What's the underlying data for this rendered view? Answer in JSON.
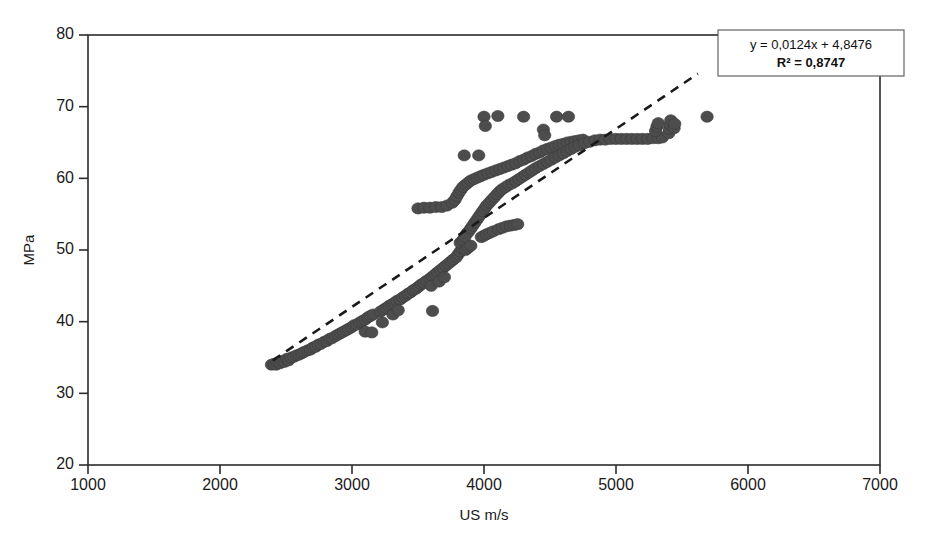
{
  "chart_data": {
    "type": "scatter",
    "title": "",
    "xlabel": "US m/s",
    "ylabel": "MPa",
    "xlim": [
      1000,
      7000
    ],
    "ylim": [
      20,
      80
    ],
    "xticks": [
      1000,
      2000,
      3000,
      4000,
      5000,
      6000,
      7000
    ],
    "yticks": [
      20,
      30,
      40,
      50,
      60,
      70,
      80
    ],
    "grid": false,
    "legend": "none",
    "marker_color": "#4d4d4d",
    "trendline_color": "#1a1a1a",
    "trendline_style": "dashed",
    "annotation": {
      "equation": "y = 0,0124x + 4,8476",
      "r_squared": "R² = 0,8747",
      "slope": 0.0124,
      "intercept": 4.8476,
      "r2": 0.8747,
      "position": "top-right"
    },
    "trendline_segment": {
      "x0": 2400,
      "y0": 34.6,
      "x1": 5620,
      "y1": 74.6
    },
    "series": [
      {
        "name": "UPV vs Compressive Strength",
        "points": [
          [
            2390,
            34.0
          ],
          [
            2410,
            34.1
          ],
          [
            2425,
            34.0
          ],
          [
            2440,
            34.3
          ],
          [
            2455,
            34.2
          ],
          [
            2470,
            34.5
          ],
          [
            2490,
            34.4
          ],
          [
            2505,
            34.8
          ],
          [
            2520,
            34.6
          ],
          [
            2540,
            35.0
          ],
          [
            2560,
            35.1
          ],
          [
            2580,
            35.3
          ],
          [
            2600,
            35.4
          ],
          [
            2620,
            35.6
          ],
          [
            2640,
            35.8
          ],
          [
            2665,
            36.0
          ],
          [
            2685,
            36.1
          ],
          [
            2705,
            36.4
          ],
          [
            2725,
            36.5
          ],
          [
            2745,
            36.8
          ],
          [
            2765,
            36.9
          ],
          [
            2790,
            37.2
          ],
          [
            2810,
            37.3
          ],
          [
            2830,
            37.6
          ],
          [
            2850,
            37.7
          ],
          [
            2875,
            38.0
          ],
          [
            2895,
            38.2
          ],
          [
            2915,
            38.4
          ],
          [
            2935,
            38.6
          ],
          [
            2955,
            38.8
          ],
          [
            2975,
            39.0
          ],
          [
            2995,
            39.2
          ],
          [
            3015,
            39.5
          ],
          [
            3035,
            39.6
          ],
          [
            3060,
            39.9
          ],
          [
            3080,
            40.1
          ],
          [
            3100,
            40.3
          ],
          [
            3120,
            40.6
          ],
          [
            3140,
            40.8
          ],
          [
            3160,
            41.0
          ],
          [
            3100,
            38.6
          ],
          [
            3150,
            38.5
          ],
          [
            3215,
            41.4
          ],
          [
            3240,
            41.7
          ],
          [
            3260,
            41.9
          ],
          [
            3280,
            42.2
          ],
          [
            3300,
            42.4
          ],
          [
            3320,
            42.6
          ],
          [
            3340,
            42.9
          ],
          [
            3365,
            43.1
          ],
          [
            3385,
            43.4
          ],
          [
            3405,
            43.6
          ],
          [
            3425,
            43.9
          ],
          [
            3445,
            44.1
          ],
          [
            3465,
            44.4
          ],
          [
            3230,
            39.9
          ],
          [
            3310,
            41.0
          ],
          [
            3350,
            41.6
          ],
          [
            3485,
            44.6
          ],
          [
            3505,
            44.9
          ],
          [
            3525,
            45.2
          ],
          [
            3545,
            45.4
          ],
          [
            3565,
            45.7
          ],
          [
            3590,
            46.0
          ],
          [
            3610,
            46.3
          ],
          [
            3630,
            46.6
          ],
          [
            3650,
            46.9
          ],
          [
            3670,
            47.2
          ],
          [
            3690,
            47.5
          ],
          [
            3710,
            47.8
          ],
          [
            3730,
            48.1
          ],
          [
            3750,
            48.4
          ],
          [
            3770,
            48.7
          ],
          [
            3790,
            49.0
          ],
          [
            3805,
            49.4
          ],
          [
            3820,
            49.8
          ],
          [
            3835,
            50.2
          ],
          [
            3850,
            50.6
          ],
          [
            3600,
            45.0
          ],
          [
            3660,
            45.6
          ],
          [
            3700,
            46.2
          ],
          [
            3610,
            41.5
          ],
          [
            3500,
            55.8
          ],
          [
            3545,
            55.9
          ],
          [
            3590,
            55.9
          ],
          [
            3635,
            56.0
          ],
          [
            3680,
            56.0
          ],
          [
            3720,
            56.2
          ],
          [
            3760,
            56.6
          ],
          [
            3780,
            57.0
          ],
          [
            3795,
            57.5
          ],
          [
            3810,
            58.0
          ],
          [
            3825,
            58.4
          ],
          [
            3840,
            58.8
          ],
          [
            3860,
            59.1
          ],
          [
            3880,
            59.4
          ],
          [
            3900,
            59.7
          ],
          [
            3925,
            59.9
          ],
          [
            3950,
            60.1
          ],
          [
            3975,
            60.3
          ],
          [
            4000,
            60.5
          ],
          [
            4030,
            60.7
          ],
          [
            4060,
            60.9
          ],
          [
            4090,
            61.1
          ],
          [
            4120,
            61.3
          ],
          [
            4150,
            61.5
          ],
          [
            4180,
            61.7
          ],
          [
            4210,
            61.9
          ],
          [
            4240,
            62.1
          ],
          [
            4270,
            62.4
          ],
          [
            4300,
            62.6
          ],
          [
            4330,
            62.9
          ],
          [
            4360,
            63.1
          ],
          [
            4390,
            63.4
          ],
          [
            4420,
            63.6
          ],
          [
            4450,
            63.9
          ],
          [
            4480,
            64.1
          ],
          [
            4510,
            64.3
          ],
          [
            4540,
            64.5
          ],
          [
            4570,
            64.7
          ],
          [
            4600,
            64.8
          ],
          [
            4630,
            65.0
          ],
          [
            4660,
            65.1
          ],
          [
            4690,
            65.2
          ],
          [
            4720,
            65.3
          ],
          [
            4750,
            65.4
          ],
          [
            3870,
            52.3
          ],
          [
            3885,
            52.6
          ],
          [
            3900,
            53.0
          ],
          [
            3915,
            53.4
          ],
          [
            3930,
            53.8
          ],
          [
            3945,
            54.2
          ],
          [
            3960,
            54.6
          ],
          [
            3975,
            55.0
          ],
          [
            3990,
            55.4
          ],
          [
            4005,
            55.8
          ],
          [
            4020,
            56.2
          ],
          [
            4040,
            56.6
          ],
          [
            4060,
            57.0
          ],
          [
            4080,
            57.4
          ],
          [
            4100,
            57.8
          ],
          [
            4120,
            58.2
          ],
          [
            4140,
            58.5
          ],
          [
            4165,
            58.8
          ],
          [
            4190,
            59.1
          ],
          [
            4215,
            59.3
          ],
          [
            4240,
            59.6
          ],
          [
            4265,
            59.9
          ],
          [
            4290,
            60.2
          ],
          [
            4315,
            60.5
          ],
          [
            4340,
            60.8
          ],
          [
            4365,
            61.1
          ],
          [
            4390,
            61.4
          ],
          [
            4420,
            61.7
          ],
          [
            4450,
            62.0
          ],
          [
            4480,
            62.3
          ],
          [
            4510,
            62.6
          ],
          [
            4540,
            62.9
          ],
          [
            4570,
            63.2
          ],
          [
            4600,
            63.5
          ],
          [
            4630,
            63.8
          ],
          [
            4660,
            64.1
          ],
          [
            4690,
            64.4
          ],
          [
            4720,
            64.6
          ],
          [
            4760,
            64.9
          ],
          [
            4800,
            65.1
          ],
          [
            4840,
            65.3
          ],
          [
            3820,
            51.0
          ],
          [
            3840,
            51.4
          ],
          [
            3855,
            51.8
          ],
          [
            3860,
            50.0
          ],
          [
            3880,
            50.3
          ],
          [
            3900,
            50.6
          ],
          [
            3980,
            51.8
          ],
          [
            4000,
            52.0
          ],
          [
            4020,
            52.2
          ],
          [
            4045,
            52.4
          ],
          [
            4070,
            52.6
          ],
          [
            4110,
            52.9
          ],
          [
            4140,
            53.1
          ],
          [
            4170,
            53.3
          ],
          [
            4200,
            53.4
          ],
          [
            4230,
            53.5
          ],
          [
            4255,
            53.6
          ],
          [
            4880,
            65.4
          ],
          [
            4920,
            65.4
          ],
          [
            4960,
            65.5
          ],
          [
            5000,
            65.5
          ],
          [
            5040,
            65.5
          ],
          [
            5080,
            65.5
          ],
          [
            5120,
            65.5
          ],
          [
            5160,
            65.5
          ],
          [
            5200,
            65.5
          ],
          [
            5240,
            65.5
          ],
          [
            5280,
            65.6
          ],
          [
            5320,
            65.6
          ],
          [
            5350,
            65.7
          ],
          [
            5300,
            66.6
          ],
          [
            5310,
            67.2
          ],
          [
            5320,
            67.7
          ],
          [
            5400,
            66.3
          ],
          [
            5405,
            66.9
          ],
          [
            5410,
            67.5
          ],
          [
            5415,
            68.1
          ],
          [
            5440,
            67.0
          ],
          [
            5445,
            67.6
          ],
          [
            3850,
            63.2
          ],
          [
            3960,
            63.2
          ],
          [
            4000,
            68.6
          ],
          [
            4010,
            67.3
          ],
          [
            4105,
            68.7
          ],
          [
            4300,
            68.6
          ],
          [
            4550,
            68.6
          ],
          [
            4640,
            68.6
          ],
          [
            4450,
            66.8
          ],
          [
            4460,
            66.0
          ],
          [
            5690,
            68.6
          ]
        ]
      }
    ]
  }
}
